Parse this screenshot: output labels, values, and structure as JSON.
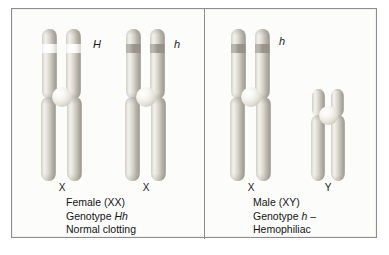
{
  "figure": {
    "panels": [
      {
        "id": "female",
        "caption_lines": [
          "Female (XX)",
          "Genotype Hh",
          "Normal clotting"
        ],
        "caption_line1": "Female (XX)",
        "caption_line2_prefix": "Genotype ",
        "caption_line2_genotype": "Hh",
        "caption_line3": "Normal clotting",
        "chromosomes": [
          {
            "sex_label": "X",
            "allele_label": "H",
            "band_style": "light"
          },
          {
            "sex_label": "X",
            "allele_label": "h",
            "band_style": "dark"
          }
        ]
      },
      {
        "id": "male",
        "caption_lines": [
          "Male (XY)",
          "Genotype h –",
          "Hemophiliac"
        ],
        "caption_line1": "Male (XY)",
        "caption_line2_prefix": "Genotype ",
        "caption_line2_genotype": "h",
        "caption_line2_suffix": " –",
        "caption_line3": "Hemophiliac",
        "chromosomes": [
          {
            "sex_label": "X",
            "allele_label": "h",
            "band_style": "dark"
          },
          {
            "sex_label": "Y",
            "allele_label": "",
            "band_style": "none"
          }
        ]
      }
    ],
    "colors": {
      "chromatid_light": "#f2f0ea",
      "chromatid_mid": "#d6d3ca",
      "chromatid_shadow": "#a5a199",
      "centromere": "#f7f6f1",
      "frame_border": "#8d8d8d",
      "background": "#fcfcfb",
      "text": "#141414"
    }
  }
}
